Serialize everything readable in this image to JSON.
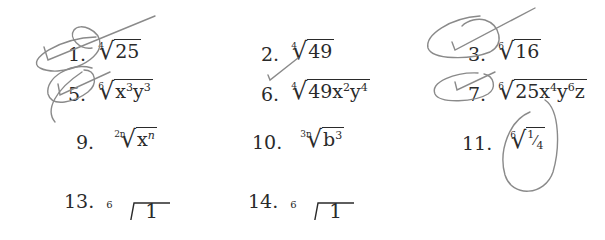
{
  "worksheet": {
    "problems": [
      {
        "number": "1.",
        "index": "4",
        "radicand": "25",
        "marked": "check-circled"
      },
      {
        "number": "2.",
        "index": "4",
        "radicand": "49",
        "marked": "check-small"
      },
      {
        "number": "3.",
        "index": "6",
        "radicand": "16",
        "marked": "check-circled"
      },
      {
        "number": "5.",
        "index": "6",
        "radicand_base1": "x",
        "exp1": "3",
        "radicand_base2": "y",
        "exp2": "3",
        "marked": "check-circled"
      },
      {
        "number": "6.",
        "index": "4",
        "radicand_coef": "49",
        "radicand_base1": "x",
        "exp1": "2",
        "radicand_base2": "y",
        "exp2": "4"
      },
      {
        "number": "7.",
        "index": "6",
        "radicand_coef": "25",
        "radicand_base1": "x",
        "exp1": "4",
        "radicand_base2": "y",
        "exp2": "6",
        "radicand_base3": "z",
        "marked": "check-circled"
      },
      {
        "number": "9.",
        "index": "2n",
        "radicand_base1": "x",
        "exp1": "n"
      },
      {
        "number": "10.",
        "index": "3n",
        "radicand_base1": "b",
        "exp1": "3"
      },
      {
        "number": "11.",
        "index": "6",
        "radicand_num": "1",
        "radicand_den": "4",
        "marked": "circled"
      },
      {
        "number": "13.",
        "index": "6",
        "numerator": "1",
        "denominator_base": "c",
        "denominator_exp": "2"
      },
      {
        "number": "14.",
        "index": "6",
        "numerator": "1",
        "denominator_base": "x",
        "denominator_exp": "3"
      }
    ],
    "ink_color": "#8a8a8a"
  }
}
